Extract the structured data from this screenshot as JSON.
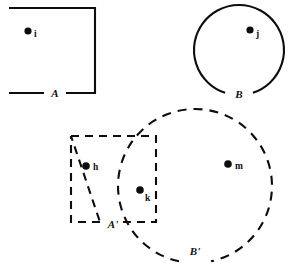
{
  "figure": {
    "kind": "set-diagram",
    "background_color": "#ffffff",
    "ink_color": "#0d0d0d",
    "stroke_width": 2.1
  },
  "regions": [
    {
      "id": "region-a",
      "label": "A",
      "shape": "square",
      "border": "solid",
      "label_position": {
        "x": 55,
        "y": 97
      },
      "geometry": {
        "x": 9,
        "y": 8,
        "width": 86,
        "height": 85
      },
      "gap": {
        "edge": "bottom",
        "from_x": 44,
        "to_x": 66
      }
    },
    {
      "id": "region-b",
      "label": "B",
      "shape": "circle",
      "border": "solid",
      "label_position": {
        "x": 228,
        "y": 98
      },
      "geometry": {
        "cx": 239,
        "cy": 50,
        "r": 45
      },
      "gap": {
        "arc_start_deg": 72,
        "arc_end_deg": 108
      }
    },
    {
      "id": "region-a-prime",
      "label": "A'",
      "shape": "square",
      "border": "dashed",
      "label_position": {
        "x": 107,
        "y": 228
      },
      "geometry": {
        "x": 71,
        "y": 136,
        "width": 85,
        "height": 86
      },
      "gap": {
        "edge": "bottom",
        "from_x": 100,
        "to_x": 122
      }
    },
    {
      "id": "region-b-prime",
      "label": "B'",
      "shape": "circle",
      "border": "dashed",
      "label_position": {
        "x": 181,
        "y": 255
      },
      "geometry": {
        "cx": 195,
        "cy": 186,
        "r": 77
      },
      "gap": {
        "arc_start_deg": 78,
        "arc_end_deg": 102
      }
    }
  ],
  "points": [
    {
      "id": "point-i",
      "label": "i",
      "x": 28,
      "y": 31,
      "radius": 3.6,
      "label_x": 34,
      "label_y": 37,
      "in_regions": [
        "A"
      ]
    },
    {
      "id": "point-j",
      "label": "j",
      "x": 250,
      "y": 30,
      "radius": 3.6,
      "label_x": 256,
      "label_y": 37,
      "in_regions": [
        "B"
      ]
    },
    {
      "id": "point-h",
      "label": "h",
      "x": 86,
      "y": 166,
      "radius": 3.8,
      "label_x": 93,
      "label_y": 170,
      "in_regions": [
        "A'"
      ]
    },
    {
      "id": "point-k",
      "label": "k",
      "x": 140,
      "y": 190,
      "radius": 3.8,
      "label_x": 145,
      "label_y": 201,
      "in_regions": [
        "A'",
        "B'"
      ]
    },
    {
      "id": "point-m",
      "label": "m",
      "x": 228,
      "y": 164,
      "radius": 3.8,
      "label_x": 235,
      "label_y": 169,
      "in_regions": [
        "B'"
      ]
    }
  ]
}
